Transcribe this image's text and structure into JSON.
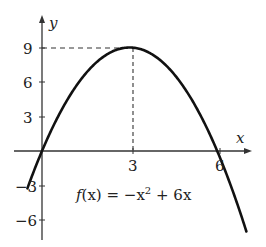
{
  "chart_data": {
    "type": "line",
    "title": "",
    "function_label": "f(x) = −x² + 6x",
    "xlabel": "x",
    "ylabel": "y",
    "x_ticks": [
      3,
      6
    ],
    "y_ticks": [
      9,
      6,
      3,
      -3,
      -6
    ],
    "x_tick_labels": [
      "3",
      "6"
    ],
    "y_tick_labels": [
      "9",
      "6",
      "3",
      "−3",
      "−6"
    ],
    "xlim": [
      -1.3,
      7.3
    ],
    "ylim": [
      -7.3,
      12
    ],
    "grid": false,
    "vertex": {
      "x": 3,
      "y": 9
    },
    "roots": [
      0,
      6
    ],
    "series": [
      {
        "name": "f(x) = −x² + 6x",
        "x": [
          -1,
          0,
          1,
          2,
          3,
          4,
          5,
          6,
          7
        ],
        "values": [
          -7,
          0,
          5,
          8,
          9,
          8,
          5,
          0,
          -7
        ]
      }
    ],
    "annotations": [
      "dashed line from y-axis at y=9 to vertex (3,9)",
      "dashed line from vertex (3,9) down to x-axis at x=3"
    ]
  },
  "labels": {
    "x_axis": "x",
    "y_axis": "y",
    "tick_3x": "3",
    "tick_6x": "6",
    "tick_9y": "9",
    "tick_6y": "6",
    "tick_3y": "3",
    "tick_m3y": "−3",
    "tick_m6y": "−6",
    "func_f": "f",
    "func_rest": "(x) = −x",
    "func_sup": "2",
    "func_tail": " + 6x"
  }
}
